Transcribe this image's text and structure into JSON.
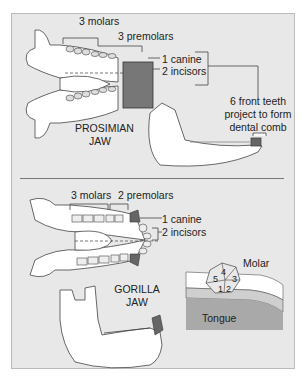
{
  "prosimian": {
    "title_line1": "PROSIMIAN",
    "title_line2": "JAW",
    "labels": {
      "molars": "3 molars",
      "premolars": "3 premolars",
      "canine": "1 canine",
      "incisors": "2 incisors",
      "comb_line1": "6 front teeth",
      "comb_line2": "project to form",
      "comb_line3": "dental comb"
    }
  },
  "gorilla": {
    "title_line1": "GORILLA",
    "title_line2": "JAW",
    "labels": {
      "molars": "3 molars",
      "premolars": "2 premolars",
      "canine": "1 canine",
      "incisors": "2 incisors"
    }
  },
  "molar_inset": {
    "title": "Molar",
    "cusps": [
      "1",
      "2",
      "3",
      "4",
      "5"
    ],
    "tongue_label": "Tongue"
  },
  "colors": {
    "background": "#e8e8e8",
    "bone": "#ffffff",
    "canine_dark": "#6d6d6d",
    "tongue": "#a9a9a9",
    "gum": "#cfcfcf"
  }
}
